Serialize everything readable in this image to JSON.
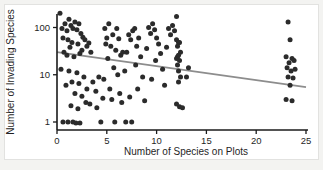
{
  "chart_data": {
    "type": "scatter",
    "title": "",
    "xlabel": "Number of Species on Plots",
    "ylabel": "Number of Invading Species",
    "xlim": [
      0,
      25
    ],
    "ylim": [
      0.7,
      300
    ],
    "yscale": "log",
    "xticks": [
      0,
      5,
      10,
      15,
      20,
      25
    ],
    "xtick_labels": [
      "0",
      "5",
      "10",
      "15",
      "20",
      "25"
    ],
    "yticks": [
      1,
      10,
      100
    ],
    "ytick_labels": [
      "1",
      "10",
      "100"
    ],
    "grid": false,
    "legend": null,
    "marker_color": "#2b2b2b",
    "trend_color": "#8d8d8d",
    "trendline": {
      "description": "negative linear fit on log y-axis",
      "x_start": 0,
      "y_start": 30,
      "x_end": 25,
      "y_end": 5.5
    },
    "points": [
      [
        0.3,
        200
      ],
      [
        0.5,
        95
      ],
      [
        0.8,
        120
      ],
      [
        1.0,
        85
      ],
      [
        1.2,
        150
      ],
      [
        0.6,
        60
      ],
      [
        1.4,
        110
      ],
      [
        1.6,
        95
      ],
      [
        1.8,
        130
      ],
      [
        2.0,
        90
      ],
      [
        2.2,
        120
      ],
      [
        1.1,
        55
      ],
      [
        1.5,
        48
      ],
      [
        2.4,
        75
      ],
      [
        2.6,
        62
      ],
      [
        2.1,
        45
      ],
      [
        1.3,
        38
      ],
      [
        2.8,
        55
      ],
      [
        3.0,
        40
      ],
      [
        2.5,
        33
      ],
      [
        3.2,
        47
      ],
      [
        0.7,
        30
      ],
      [
        1.0,
        26
      ],
      [
        1.7,
        24
      ],
      [
        2.3,
        28
      ],
      [
        3.4,
        30
      ],
      [
        0.4,
        13
      ],
      [
        1.2,
        12
      ],
      [
        2.0,
        11
      ],
      [
        2.7,
        9
      ],
      [
        1.5,
        7
      ],
      [
        0.9,
        6
      ],
      [
        2.2,
        6.5
      ],
      [
        3.0,
        5
      ],
      [
        1.8,
        4
      ],
      [
        2.5,
        3.5
      ],
      [
        3.6,
        7
      ],
      [
        4.2,
        9
      ],
      [
        3.9,
        4.5
      ],
      [
        4.6,
        3.2
      ],
      [
        2.9,
        2.6
      ],
      [
        1.4,
        2.2
      ],
      [
        2.1,
        1.9
      ],
      [
        3.3,
        2.4
      ],
      [
        4.0,
        2.0
      ],
      [
        0.6,
        1.0
      ],
      [
        1.1,
        1.0
      ],
      [
        1.6,
        1.0
      ],
      [
        1.9,
        0.95
      ],
      [
        2.3,
        0.95
      ],
      [
        4.4,
        1.0
      ],
      [
        5.8,
        1.0
      ],
      [
        6.9,
        1.0
      ],
      [
        7.5,
        1.0
      ],
      [
        4.8,
        95
      ],
      [
        5.2,
        120
      ],
      [
        5.0,
        60
      ],
      [
        5.6,
        70
      ],
      [
        4.9,
        45
      ],
      [
        5.4,
        40
      ],
      [
        6.0,
        95
      ],
      [
        6.2,
        58
      ],
      [
        5.9,
        33
      ],
      [
        6.4,
        26
      ],
      [
        5.1,
        22
      ],
      [
        6.6,
        30
      ],
      [
        5.7,
        14
      ],
      [
        6.1,
        10
      ],
      [
        4.7,
        8
      ],
      [
        6.8,
        12
      ],
      [
        5.3,
        5
      ],
      [
        6.3,
        4
      ],
      [
        5.5,
        3
      ],
      [
        6.5,
        2.6
      ],
      [
        7.2,
        70
      ],
      [
        7.8,
        95
      ],
      [
        7.4,
        55
      ],
      [
        8.0,
        40
      ],
      [
        7.6,
        85
      ],
      [
        8.2,
        60
      ],
      [
        7.0,
        30
      ],
      [
        8.4,
        24
      ],
      [
        7.9,
        16
      ],
      [
        8.6,
        9
      ],
      [
        8.1,
        5
      ],
      [
        7.3,
        3.4
      ],
      [
        8.8,
        2.8
      ],
      [
        9.2,
        100
      ],
      [
        9.6,
        120
      ],
      [
        9.4,
        75
      ],
      [
        10.0,
        60
      ],
      [
        9.8,
        90
      ],
      [
        10.2,
        45
      ],
      [
        9.0,
        36
      ],
      [
        10.4,
        28
      ],
      [
        9.9,
        20
      ],
      [
        10.6,
        13
      ],
      [
        9.5,
        8
      ],
      [
        10.8,
        6
      ],
      [
        11.2,
        95
      ],
      [
        11.6,
        110
      ],
      [
        11.4,
        70
      ],
      [
        12.0,
        55
      ],
      [
        11.8,
        85
      ],
      [
        12.2,
        48
      ],
      [
        11.0,
        38
      ],
      [
        12.4,
        30
      ],
      [
        12.1,
        24
      ],
      [
        12.0,
        170
      ],
      [
        12.3,
        48
      ],
      [
        12.1,
        40
      ],
      [
        12.2,
        26
      ],
      [
        12.0,
        22
      ],
      [
        12.3,
        20
      ],
      [
        12.1,
        16
      ],
      [
        12.2,
        12
      ],
      [
        12.4,
        9
      ],
      [
        12.2,
        7
      ],
      [
        12.0,
        2.4
      ],
      [
        12.3,
        2.1
      ],
      [
        12.6,
        2.0
      ],
      [
        13.2,
        14
      ],
      [
        13.0,
        9
      ],
      [
        23.2,
        130
      ],
      [
        23.4,
        55
      ],
      [
        23.0,
        24
      ],
      [
        23.6,
        22
      ],
      [
        23.3,
        18
      ],
      [
        23.8,
        20
      ],
      [
        23.1,
        14
      ],
      [
        23.5,
        12
      ],
      [
        23.9,
        13
      ],
      [
        23.2,
        9
      ],
      [
        23.7,
        8.5
      ],
      [
        23.4,
        6
      ],
      [
        23.0,
        3.0
      ],
      [
        23.6,
        2.8
      ]
    ]
  },
  "geometry": {
    "plot_left_px": 57,
    "plot_right_px": 306,
    "y_px_at_1": 122,
    "y_px_at_10": 77.5,
    "y_px_at_100": 27.5,
    "x_px_per_unit": 9.96,
    "axis_bottom_px": 130,
    "axis_top_px": 14
  }
}
